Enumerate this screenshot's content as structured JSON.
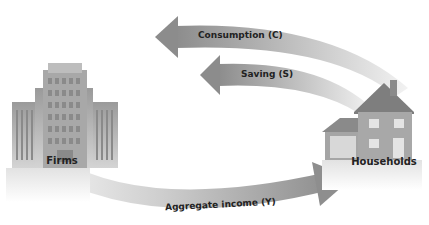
{
  "diagram": {
    "nodes": {
      "firms": {
        "label": "Firms"
      },
      "households": {
        "label": "Households"
      }
    },
    "flows": {
      "consumption": {
        "label": "Consumption (C)",
        "from": "Households",
        "to": "Firms"
      },
      "saving": {
        "label": "Saving (S)",
        "from": "Households",
        "to": "Firms"
      },
      "income": {
        "label": "Aggregate income (Y)",
        "from": "Firms",
        "to": "Households"
      }
    },
    "colors": {
      "arrow_dark": "#8f8f8f",
      "arrow_light": "#ececec",
      "building": "#b5b5b5",
      "house": "#9a9a9a"
    }
  }
}
